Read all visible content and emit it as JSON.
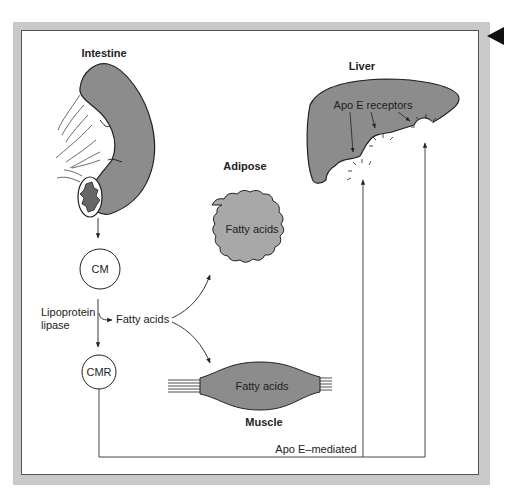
{
  "organs": {
    "intestine": "Intestine",
    "liver": "Liver",
    "adipose": "Adipose",
    "muscle": "Muscle"
  },
  "particles": {
    "cm": "CM",
    "cmr": "CMR"
  },
  "labels": {
    "lipoprotein_line1": "Lipoprotein",
    "lipoprotein_line2": "lipase",
    "fatty_acids_flow": "Fatty acids",
    "adipose_content": "Fatty acids",
    "muscle_content": "Fatty acids",
    "apo_e_receptors": "Apo E receptors",
    "apo_e_mediated": "Apo E–mediated"
  },
  "navigation": {
    "back_icon": "triangle-left"
  },
  "colors": {
    "organ_fill": "#8c8c8c",
    "adipose_fill": "#a8a8a8",
    "frame": "#c9c9c9",
    "line": "#333333"
  }
}
